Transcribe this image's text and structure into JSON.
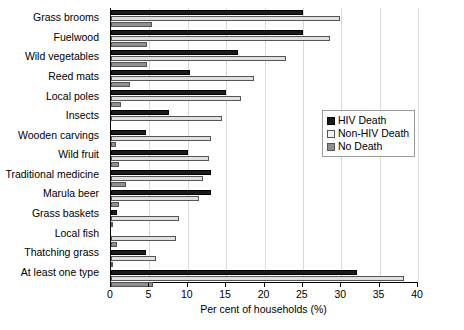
{
  "chart_data": {
    "type": "bar",
    "orientation": "horizontal",
    "title": "",
    "xlabel": "Per cent of households (%)",
    "ylabel": "",
    "xlim": [
      0,
      40
    ],
    "xticks": [
      0,
      5,
      10,
      15,
      20,
      25,
      30,
      35,
      40
    ],
    "grid": true,
    "legend_position": "right-middle",
    "categories": [
      "Grass brooms",
      "Fuelwood",
      "Wild vegetables",
      "Reed mats",
      "Local poles",
      "Insects",
      "Wooden carvings",
      "Wild fruit",
      "Traditional medicine",
      "Marula beer",
      "Grass baskets",
      "Local fish",
      "Thatching grass",
      "At least one type"
    ],
    "series": [
      {
        "name": "HIV Death",
        "color": "#1a1a1a",
        "values": [
          25.0,
          25.0,
          16.5,
          10.3,
          15.0,
          7.5,
          4.5,
          10.0,
          13.0,
          13.0,
          0.8,
          0.0,
          4.5,
          32.0
        ]
      },
      {
        "name": "Non-HIV Death",
        "color": "#e0e0e0",
        "values": [
          29.8,
          28.5,
          22.8,
          18.6,
          17.0,
          14.5,
          13.0,
          12.8,
          12.0,
          11.5,
          8.8,
          8.5,
          5.8,
          38.2
        ]
      },
      {
        "name": "No Death",
        "color": "#8f8f8f",
        "values": [
          5.3,
          4.7,
          4.7,
          2.5,
          1.3,
          0.0,
          0.6,
          1.0,
          2.0,
          1.0,
          0.2,
          0.8,
          0.2,
          5.5
        ]
      }
    ]
  },
  "legend": {
    "items": [
      {
        "label": "HIV Death"
      },
      {
        "label": "Non-HIV Death"
      },
      {
        "label": "No Death"
      }
    ]
  }
}
